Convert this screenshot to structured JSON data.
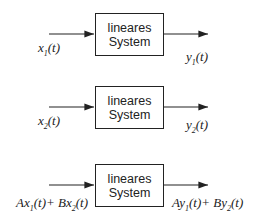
{
  "blocks": [
    {
      "line1": "lineares",
      "line2": "System",
      "input": "x1(t)",
      "output": "y1(t)"
    },
    {
      "line1": "lineares",
      "line2": "System",
      "input": "x2(t)",
      "output": "y2(t)"
    },
    {
      "line1": "lineares",
      "line2": "System",
      "input": "Ax1(t)+ Bx2(t)",
      "output": "Ay1(t)+ By2(t)"
    }
  ]
}
